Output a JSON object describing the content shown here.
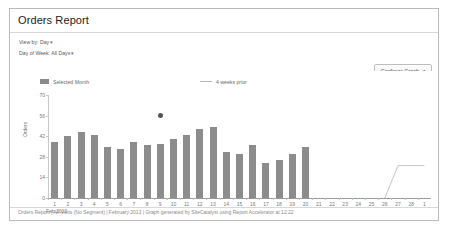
{
  "report": {
    "title": "Orders Report",
    "controls": [
      {
        "label": "View by: Day",
        "caret": "▾"
      },
      {
        "label": "Day of Week: All Days",
        "caret": "▾"
      }
    ],
    "configure_button": {
      "label": "Configure Graph",
      "caret": "▾"
    },
    "footer": "Orders Report | All Visits (No Segment) | February 2013 | Graph generated by SiteCatalyst using Report Accelerator at 12:22"
  },
  "colors": {
    "bar": "#8c8c8c",
    "prior_line": "#c4c4c4",
    "marker": "#555555",
    "axis": "#9a9a9a",
    "card_border": "#b9b9b9"
  },
  "chart_data": {
    "type": "bar",
    "title": "Orders Report",
    "xlabel": "",
    "ylabel": "Orders",
    "month_label": "Feb 2013",
    "ylim": [
      0,
      70
    ],
    "yticks": [
      0,
      14,
      28,
      42,
      56,
      70
    ],
    "grid": false,
    "legend_position": "top",
    "categories": [
      "1",
      "2",
      "3",
      "4",
      "5",
      "6",
      "7",
      "8",
      "9",
      "10",
      "11",
      "12",
      "13",
      "14",
      "15",
      "16",
      "17",
      "18",
      "19",
      "20",
      "21",
      "22",
      "23",
      "24",
      "25",
      "26",
      "27",
      "28",
      "1"
    ],
    "series": [
      {
        "name": "Selected Month",
        "type": "bar",
        "values": [
          38,
          42,
          45,
          43,
          35,
          33,
          38,
          36,
          37,
          40,
          43,
          47,
          48,
          31,
          30,
          36,
          24,
          26,
          30,
          35,
          null,
          null,
          null,
          null,
          null,
          null,
          null,
          null,
          null
        ]
      },
      {
        "name": "4 weeks prior",
        "type": "line",
        "values": [
          null,
          null,
          null,
          null,
          null,
          null,
          null,
          null,
          null,
          null,
          null,
          null,
          null,
          null,
          null,
          null,
          null,
          null,
          null,
          null,
          null,
          null,
          null,
          null,
          null,
          0,
          22,
          22,
          22
        ]
      }
    ],
    "annotations": [
      {
        "name": "marker-point",
        "x_index": 8,
        "value": 56,
        "shape": "dot"
      }
    ]
  }
}
